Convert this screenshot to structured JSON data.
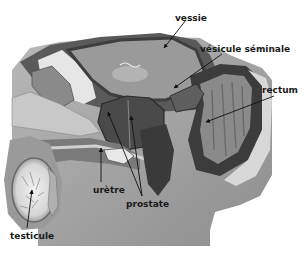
{
  "diagram": {
    "title": "",
    "type": "anatomical-cross-section",
    "color_scheme": "grayscale",
    "labels": [
      {
        "id": "vessie",
        "text": "vessie",
        "x": 175,
        "y": 14
      },
      {
        "id": "vesicule",
        "text": "vésicule séminale",
        "x": 200,
        "y": 45
      },
      {
        "id": "rectum",
        "text": "rectum",
        "x": 262,
        "y": 86
      },
      {
        "id": "uretre",
        "text": "urètre",
        "x": 93,
        "y": 186
      },
      {
        "id": "prostate",
        "text": "prostate",
        "x": 126,
        "y": 200
      },
      {
        "id": "testicule",
        "text": "testicule",
        "x": 10,
        "y": 232
      }
    ]
  }
}
